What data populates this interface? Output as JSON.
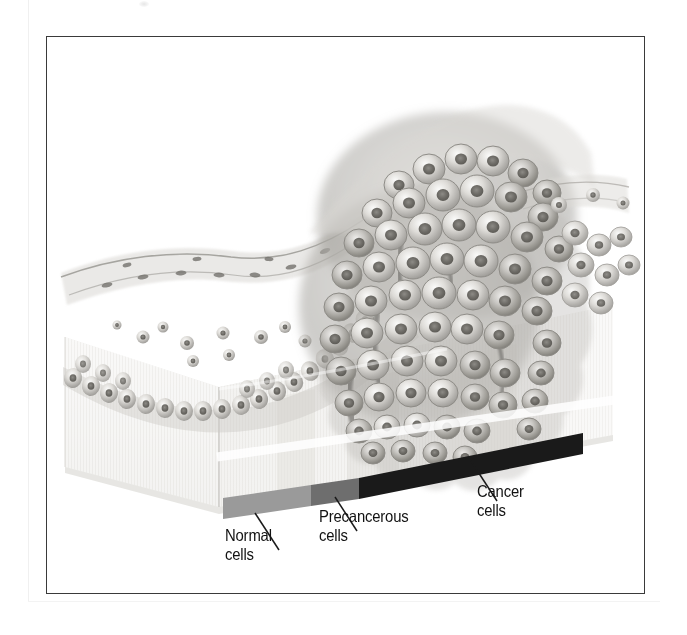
{
  "figure": {
    "kind": "medical-illustration",
    "style": "grayscale airbrush / pencil rendering",
    "frame_border_color": "#3a3a3a",
    "background_color": "#ffffff"
  },
  "labels": [
    {
      "id": "normal",
      "text": "Normal\ncells",
      "line1": "Normal",
      "line2": "cells"
    },
    {
      "id": "precancerous",
      "text": "Precancerous\ncells",
      "line1": "Precancerous",
      "line2": "cells"
    },
    {
      "id": "cancer",
      "text": "Cancer\ncells",
      "line1": "Cancer",
      "line2": "cells"
    }
  ],
  "scale_bar": {
    "orientation": "sloped-upward-to-the-right",
    "segments": [
      {
        "id": "normal",
        "label": "Normal cells",
        "color": "#9a9a9a",
        "fraction": 0.38
      },
      {
        "id": "precancerous",
        "label": "Precancerous cells",
        "color": "#6e6e6e",
        "fraction": 0.14
      },
      {
        "id": "cancer",
        "label": "Cancer cells",
        "color": "#1a1a1a",
        "fraction": 0.48
      }
    ]
  },
  "tissue": {
    "block_face_color": "#eceae6",
    "block_side_color": "#e2e0dc",
    "epithelium_tone": "#b9b7b3",
    "nucleus_tone": "#6b6b6b",
    "tumor_mass_tone": "#8e8c88"
  }
}
